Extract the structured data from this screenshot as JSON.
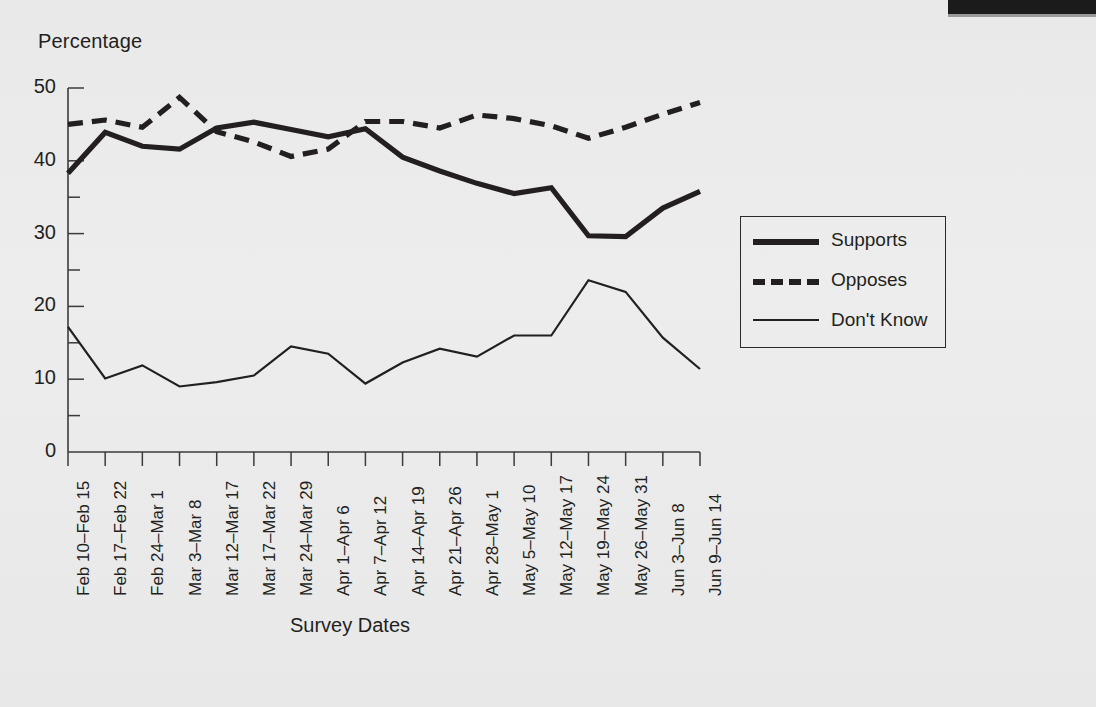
{
  "chart_data": {
    "type": "line",
    "title": "",
    "ylabel": "Percentage",
    "xlabel": "Survey Dates",
    "ylim": [
      0,
      50
    ],
    "yticks": [
      0,
      10,
      20,
      30,
      40,
      50
    ],
    "ytick_labels": [
      "0",
      "10",
      "20",
      "30",
      "40",
      "50"
    ],
    "minor_yticks": [
      5,
      15,
      25,
      35,
      45
    ],
    "grid": false,
    "legend_position": "right",
    "categories": [
      "Feb 10–Feb 15",
      "Feb 17–Feb 22",
      "Feb 24–Mar 1",
      "Mar 3–Mar 8",
      "Mar 12–Mar 17",
      "Mar 17–Mar 22",
      "Mar 24–Mar 29",
      "Apr 1–Apr 6",
      "Apr 7–Apr 12",
      "Apr 14–Apr 19",
      "Apr 21–Apr 26",
      "Apr 28–May 1",
      "May 5–May 10",
      "May 12–May 17",
      "May 19–May 24",
      "May 26–May 31",
      "Jun 3–Jun 8",
      "Jun 9–Jun 14"
    ],
    "series": [
      {
        "name": "Supports",
        "style": "thick-solid",
        "color": "#231f20",
        "values": [
          38.3,
          43.9,
          42.0,
          41.6,
          44.5,
          45.3,
          44.3,
          43.3,
          44.4,
          40.5,
          38.6,
          36.9,
          35.5,
          36.3,
          29.7,
          29.6,
          33.5,
          35.8
        ]
      },
      {
        "name": "Opposes",
        "style": "thick-dashed",
        "color": "#231f20",
        "values": [
          45.0,
          45.6,
          44.6,
          48.7,
          44.0,
          42.6,
          40.6,
          41.6,
          45.4,
          45.4,
          44.5,
          46.3,
          45.8,
          44.8,
          43.1,
          44.6,
          46.4,
          48.0
        ]
      },
      {
        "name": "Don't Know",
        "style": "thin-solid",
        "color": "#231f20",
        "values": [
          17.2,
          10.1,
          11.9,
          9.0,
          9.6,
          10.5,
          14.5,
          13.5,
          9.4,
          12.3,
          14.2,
          13.1,
          16.0,
          16.0,
          23.6,
          22.0,
          15.7,
          11.4
        ]
      }
    ]
  },
  "axes": {
    "y_axis_title": "Percentage",
    "x_axis_title": "Survey Dates"
  },
  "legend": {
    "items": [
      {
        "label": "Supports",
        "style": "thick-solid"
      },
      {
        "label": "Opposes",
        "style": "thick-dashed"
      },
      {
        "label": "Don't Know",
        "style": "thin-solid"
      }
    ]
  },
  "colors": {
    "ink": "#231f20",
    "background": "#ebebeb",
    "scan_edge": "#1b1b1b"
  }
}
